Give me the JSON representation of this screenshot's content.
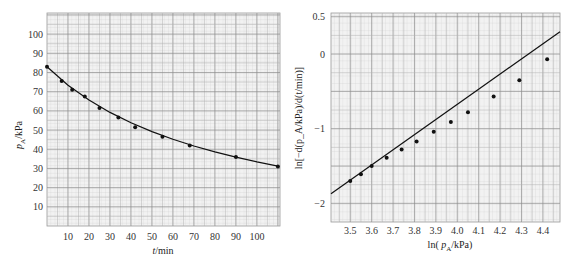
{
  "chart_data": [
    {
      "type": "scatter",
      "title": "",
      "xlabel": "t/min",
      "ylabel": "p_A/kPa",
      "xlim": [
        0,
        111
      ],
      "ylim": [
        0,
        111
      ],
      "xticks": [
        10,
        20,
        30,
        40,
        50,
        60,
        70,
        80,
        90,
        100
      ],
      "yticks": [
        10,
        20,
        30,
        40,
        50,
        60,
        70,
        80,
        90,
        100
      ],
      "grid": true,
      "series": [
        {
          "name": "measured",
          "x": [
            0,
            7,
            12,
            18,
            25,
            34,
            42,
            55,
            68,
            90,
            110
          ],
          "y": [
            83,
            75.6,
            71,
            67.5,
            61.5,
            56.5,
            51.5,
            46.5,
            42,
            36,
            31
          ]
        },
        {
          "name": "fitted curve",
          "style": "smooth line",
          "x": [
            0,
            10,
            20,
            30,
            40,
            50,
            60,
            70,
            80,
            90,
            100,
            110
          ],
          "y": [
            83,
            73.4,
            65.6,
            59.2,
            53.8,
            49.2,
            45.2,
            41.7,
            38.6,
            35.9,
            33.4,
            31.2
          ]
        }
      ]
    },
    {
      "type": "scatter",
      "title": "",
      "xlabel": "ln( p_A/kPa)",
      "ylabel": "ln[−d(p_A/kPa)/d(t/min)]",
      "xlim": [
        3.41,
        4.48
      ],
      "ylim": [
        -2.25,
        0.55
      ],
      "xticks": [
        3.5,
        3.6,
        3.7,
        3.8,
        3.9,
        4.0,
        4.1,
        4.2,
        4.3,
        4.4
      ],
      "yticks": [
        0.5,
        0,
        -1,
        -2
      ],
      "grid": true,
      "series": [
        {
          "name": "data",
          "x": [
            3.5,
            3.55,
            3.6,
            3.67,
            3.74,
            3.81,
            3.89,
            3.97,
            4.05,
            4.17,
            4.29,
            4.42
          ],
          "y": [
            -1.7,
            -1.61,
            -1.5,
            -1.39,
            -1.28,
            -1.17,
            -1.04,
            -0.91,
            -0.78,
            -0.57,
            -0.35,
            -0.07
          ]
        },
        {
          "name": "fit line",
          "style": "straight line",
          "x": [
            3.41,
            4.48
          ],
          "y": [
            -1.87,
            0.3
          ]
        }
      ]
    }
  ],
  "left_chart": {
    "ylabel_main": "p",
    "ylabel_sub": "A",
    "ylabel_unit": "/kPa",
    "xlabel_var": "t",
    "xlabel_unit": "/min"
  },
  "right_chart": {
    "xlabel_pre": "ln( ",
    "xlabel_var": "p",
    "xlabel_sub": "A",
    "xlabel_post": "/kPa)",
    "ylabel": "ln[−d(p_A/kPa)/d(t/min)]"
  }
}
